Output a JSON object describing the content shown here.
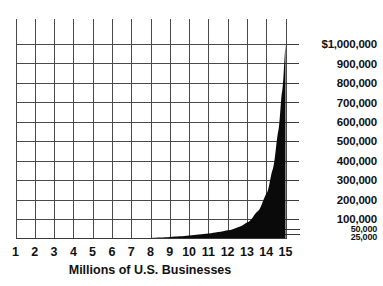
{
  "chart_data": {
    "type": "area",
    "title": "",
    "xlabel": "Millions of U.S. Businesses",
    "ylabel": "",
    "grid": true,
    "legend": null,
    "xlim": [
      1,
      15
    ],
    "ylim": [
      0,
      1000000
    ],
    "x_tick_labels": [
      "1",
      "2",
      "3",
      "4",
      "5",
      "6",
      "7",
      "8",
      "9",
      "10",
      "11",
      "12",
      "13",
      "14",
      "15"
    ],
    "x": [
      1,
      2,
      3,
      4,
      5,
      6,
      7,
      8,
      9,
      10,
      11,
      12,
      13,
      14,
      15
    ],
    "y_tick_labels": [
      "$1,000,000",
      "900,000",
      "800,000",
      "700,000",
      "600,000",
      "500,000",
      "400,000",
      "300,000",
      "200,000",
      "100,000",
      "50,000",
      "25,000"
    ],
    "y_tick_values": [
      1000000,
      900000,
      800000,
      700000,
      600000,
      500000,
      400000,
      300000,
      200000,
      100000,
      50000,
      25000
    ],
    "y_minor_ticks": [
      50000,
      25000
    ],
    "series": [
      {
        "name": "Revenue per business",
        "values": [
          0,
          0,
          0,
          0,
          0,
          0,
          1000,
          3000,
          8000,
          16000,
          26000,
          42000,
          82000,
          230000,
          1000000
        ]
      }
    ],
    "curve_points": [
      {
        "x": 1,
        "y": 0
      },
      {
        "x": 2,
        "y": 0
      },
      {
        "x": 3,
        "y": 0
      },
      {
        "x": 4,
        "y": 0
      },
      {
        "x": 5,
        "y": 0
      },
      {
        "x": 6,
        "y": 0
      },
      {
        "x": 7,
        "y": 1000
      },
      {
        "x": 7.5,
        "y": 2000
      },
      {
        "x": 8,
        "y": 3000
      },
      {
        "x": 8.5,
        "y": 5000
      },
      {
        "x": 9,
        "y": 8000
      },
      {
        "x": 9.5,
        "y": 11000
      },
      {
        "x": 10,
        "y": 16000
      },
      {
        "x": 10.5,
        "y": 21000
      },
      {
        "x": 11,
        "y": 26000
      },
      {
        "x": 11.5,
        "y": 33000
      },
      {
        "x": 12,
        "y": 42000
      },
      {
        "x": 12.5,
        "y": 57000
      },
      {
        "x": 13,
        "y": 82000
      },
      {
        "x": 13.5,
        "y": 135000
      },
      {
        "x": 14,
        "y": 230000
      },
      {
        "x": 14.3,
        "y": 345000
      },
      {
        "x": 14.6,
        "y": 540000
      },
      {
        "x": 14.8,
        "y": 740000
      },
      {
        "x": 15,
        "y": 1000000
      }
    ]
  },
  "colors": {
    "background": "#ffffff",
    "grid": "#4a4a4a",
    "axis": "#3a3a3a",
    "curve_fill": "#0a0a0a",
    "text": "#111111"
  }
}
